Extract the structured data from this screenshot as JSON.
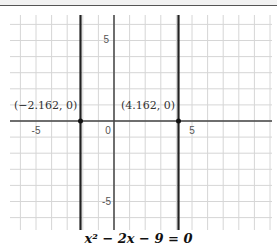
{
  "chart_data": {
    "type": "line",
    "title": "",
    "equation": "x² − 2x − 9 = 0",
    "xlabel": "",
    "ylabel": "",
    "xlim": [
      -6.5,
      10
    ],
    "ylim": [
      -6.7,
      6.6
    ],
    "grid": true,
    "x_ticks": [
      -5,
      0,
      5
    ],
    "y_ticks": [
      5,
      -5
    ],
    "series": [
      {
        "name": "x = -2.162",
        "type": "vertical-line",
        "x": -2.162
      },
      {
        "name": "x = 4.162",
        "type": "vertical-line",
        "x": 4.162
      }
    ],
    "points": [
      {
        "x": -2.162,
        "y": 0,
        "label": "(−2.162, 0)"
      },
      {
        "x": 4.162,
        "y": 0,
        "label": "(4.162, 0)"
      }
    ]
  },
  "labels": {
    "tick_x_neg5": "-5",
    "tick_x_0": "0",
    "tick_x_5": "5",
    "tick_y_5": "5",
    "tick_y_neg5": "-5",
    "point_left": "(−2.162, 0)",
    "point_right": "(4.162, 0)",
    "equation": "x² − 2x − 9 = 0"
  }
}
